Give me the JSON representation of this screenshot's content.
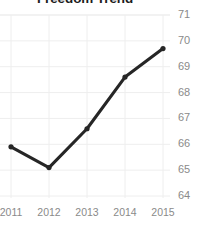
{
  "chart_data": {
    "type": "line",
    "title": "Freedom Trend",
    "xlabel": "",
    "ylabel": "",
    "categories": [
      "2011",
      "2012",
      "2013",
      "2014",
      "2015"
    ],
    "x": [
      2011,
      2012,
      2013,
      2014,
      2015
    ],
    "values": [
      65.9,
      65.1,
      66.6,
      68.6,
      69.7
    ],
    "series": [
      {
        "name": "Freedom Trend",
        "values": [
          65.9,
          65.1,
          66.6,
          68.6,
          69.7
        ]
      }
    ],
    "xlim": [
      2010.8,
      2015.2
    ],
    "ylim": [
      63.6,
      71.2
    ],
    "yticks": [
      64,
      65,
      66,
      67,
      68,
      69,
      70,
      71
    ],
    "ytick_labels": [
      "64",
      "65",
      "66",
      "67",
      "68",
      "69",
      "70",
      "71"
    ],
    "xticks": [
      2011,
      2012,
      2013,
      2014,
      2015
    ],
    "xtick_labels": [
      "2011",
      "2012",
      "2013",
      "2014",
      "2015"
    ],
    "grid": true,
    "grid_color": "#eeeeee",
    "legend": false,
    "legend_position": "none",
    "line_color": "#262626",
    "marker_color": "#262626",
    "marker": "circle",
    "tick_label_color": "#8a8a8a",
    "title_color": "#1c1c1c",
    "background_color": "#ffffff",
    "annotations": []
  }
}
